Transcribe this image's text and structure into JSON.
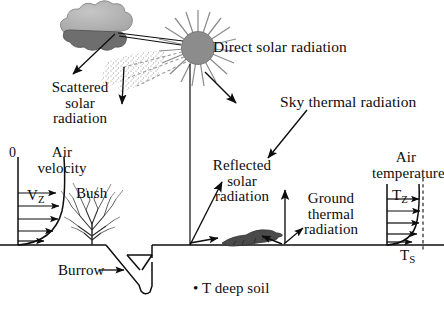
{
  "figure": {
    "title_text": "Thermal environment of a desert animal",
    "background_color": "#ffffff",
    "ink_color": "#0d0d0d",
    "sun_color": "#8c8c8c",
    "cloud_top_color": "#b0b0b0",
    "cloud_bottom_color": "#6e6e6e",
    "animal_color": "#4a4a4a",
    "width": 444,
    "height": 319
  },
  "labels": {
    "direct_solar_radiation": "Direct solar radiation",
    "scattered_solar_radiation": "Scattered\nsolar\nradiation",
    "sky_thermal_radiation": "Sky thermal radiation",
    "reflected_solar_radiation": "Reflected\nsolar\nradiation",
    "ground_thermal_radiation": "Ground\nthermal\nradiation",
    "air_velocity": "Air\nvelocity",
    "air_temperature": "Air\ntemperature",
    "bush": "Bush",
    "burrow": "Burrow",
    "t_deep_soil": "• T deep soil",
    "zero": "0"
  },
  "symbols": {
    "v_base": "V",
    "v_sub": "Z",
    "tz_base": "T",
    "tz_sub": "Z",
    "ts_base": "T",
    "ts_sub": "S"
  },
  "elements": {
    "sun": "sun-symbol",
    "cloud": "cloud-symbol",
    "bush": "bush-symbol",
    "lizard": "lizard-symbol",
    "burrow": "burrow-tunnel",
    "ground": "ground-line",
    "velocity_profile": "wind-velocity-profile",
    "temperature_profile": "air-temperature-profile",
    "scatter_stipple": "scattered-radiation-stipple"
  }
}
